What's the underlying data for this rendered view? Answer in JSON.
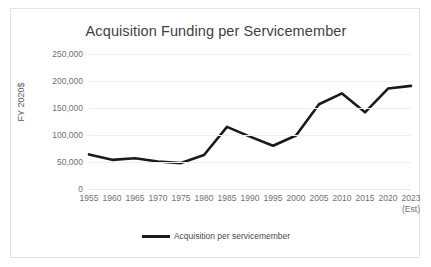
{
  "chart_data": {
    "type": "line",
    "title": "Acquisition Funding per Servicemember",
    "xlabel": "",
    "ylabel": "FY 2020$",
    "categories": [
      "1955",
      "1960",
      "1965",
      "1970",
      "1975",
      "1980",
      "1985",
      "1990",
      "1995",
      "2000",
      "2005",
      "2010",
      "2015",
      "2020",
      "2023"
    ],
    "x_tick_sublabels": {
      "2023": "(Est)"
    },
    "series": [
      {
        "name": "Acquisition per servicemember",
        "color": "#1a1a1a",
        "values": [
          64000,
          54000,
          57000,
          51000,
          48000,
          63000,
          115000,
          97000,
          80000,
          99000,
          157000,
          177000,
          142000,
          186000,
          191000
        ]
      }
    ],
    "ylim": [
      0,
      250000
    ],
    "y_ticks": [
      0,
      50000,
      100000,
      150000,
      200000,
      250000
    ],
    "y_tick_labels": [
      "0",
      "50,000",
      "100,000",
      "150,000",
      "200,000",
      "250,000"
    ],
    "grid": true,
    "legend_position": "bottom",
    "legend_entries": [
      "Acquisition per servicemember"
    ]
  }
}
